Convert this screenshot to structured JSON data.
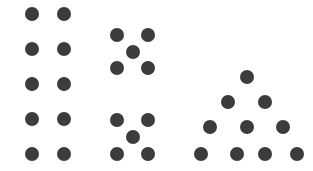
{
  "figure": {
    "background_color": "#ffffff",
    "dot_color": "#3c3c3c",
    "dot_diameter": 14,
    "width": 313,
    "height": 171,
    "total_dots": 30,
    "groups": [
      {
        "name": "rectangular-array-group",
        "label": "2 by 5 rectangular array",
        "arrangement": "rectangle",
        "rows": 5,
        "columns": 2,
        "count": 10,
        "dots": [
          {
            "x": 25,
            "y": 7
          },
          {
            "x": 57,
            "y": 7
          },
          {
            "x": 25,
            "y": 42
          },
          {
            "x": 57,
            "y": 42
          },
          {
            "x": 25,
            "y": 77
          },
          {
            "x": 57,
            "y": 77
          },
          {
            "x": 25,
            "y": 112
          },
          {
            "x": 57,
            "y": 112
          },
          {
            "x": 25,
            "y": 147
          },
          {
            "x": 57,
            "y": 147
          }
        ]
      },
      {
        "name": "quincunx-group-upper",
        "label": "upper five-dot quincunx",
        "arrangement": "quincunx",
        "count": 5,
        "dots": [
          {
            "x": 110,
            "y": 28
          },
          {
            "x": 141,
            "y": 28
          },
          {
            "x": 126,
            "y": 45
          },
          {
            "x": 110,
            "y": 61
          },
          {
            "x": 141,
            "y": 61
          }
        ]
      },
      {
        "name": "quincunx-group-lower",
        "label": "lower five-dot quincunx",
        "arrangement": "quincunx",
        "count": 5,
        "dots": [
          {
            "x": 110,
            "y": 113
          },
          {
            "x": 141,
            "y": 113
          },
          {
            "x": 126,
            "y": 130
          },
          {
            "x": 110,
            "y": 147
          },
          {
            "x": 141,
            "y": 147
          }
        ]
      },
      {
        "name": "triangular-array-group",
        "label": "triangular array of ten dots",
        "arrangement": "triangle",
        "rows": 4,
        "count": 10,
        "row_counts": [
          1,
          2,
          3,
          4
        ],
        "dots": [
          {
            "x": 240,
            "y": 70
          },
          {
            "x": 221,
            "y": 95
          },
          {
            "x": 258,
            "y": 95
          },
          {
            "x": 203,
            "y": 120
          },
          {
            "x": 240,
            "y": 120
          },
          {
            "x": 276,
            "y": 120
          },
          {
            "x": 194,
            "y": 147
          },
          {
            "x": 230,
            "y": 147
          },
          {
            "x": 258,
            "y": 147
          },
          {
            "x": 290,
            "y": 147
          }
        ]
      }
    ]
  }
}
